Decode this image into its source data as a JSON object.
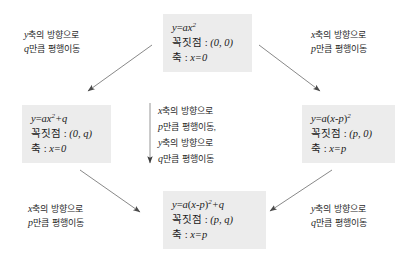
{
  "diagram": {
    "boxes": [
      {
        "id": "box-top",
        "equation_plain": "y=ax2",
        "equation_parts": {
          "lhs": "y",
          "eq": "=",
          "coef": "a",
          "var": "x",
          "exp": "2"
        },
        "vertex_label": "꼭짓점 :",
        "vertex_value": "(0, 0)",
        "axis_label": "축 :",
        "axis_value": "x=0"
      },
      {
        "id": "box-left",
        "equation_plain": "y=ax2+q",
        "equation_parts": {
          "lhs": "y",
          "eq": "=",
          "coef": "a",
          "var": "x",
          "exp": "2",
          "tail": "+q"
        },
        "vertex_label": "꼭짓점 :",
        "vertex_value": "(0, q)",
        "axis_label": "축 :",
        "axis_value": "x=0"
      },
      {
        "id": "box-right",
        "equation_plain": "y=a(x-p)2",
        "equation_parts": {
          "lhs": "y",
          "eq": "=",
          "coef": "a",
          "open": "(",
          "var": "x",
          "minus": "-",
          "param": "p",
          "close": ")",
          "exp": "2"
        },
        "vertex_label": "꼭짓점 :",
        "vertex_value": "(p, 0)",
        "axis_label": "축 :",
        "axis_value": "x=p"
      },
      {
        "id": "box-bottom",
        "equation_plain": "y=a(x-p)2+q",
        "equation_parts": {
          "lhs": "y",
          "eq": "=",
          "coef": "a",
          "open": "(",
          "var": "x",
          "minus": "-",
          "param": "p",
          "close": ")",
          "exp": "2",
          "tail": "+q"
        },
        "vertex_label": "꼭짓점 :",
        "vertex_value": "(p, q)",
        "axis_label": "축 :",
        "axis_value": "x=p"
      }
    ],
    "labels": {
      "top_left": {
        "line1_var": "y",
        "line1_text": "축의 방향으로",
        "line2_var": "q",
        "line2_text": "만큼 평행이동"
      },
      "top_right": {
        "line1_var": "x",
        "line1_text": "축의 방향으로",
        "line2_var": "p",
        "line2_text": "만큼 평행이동"
      },
      "bottom_left": {
        "line1_var": "x",
        "line1_text": "축의 방향으로",
        "line2_var": "p",
        "line2_text": "만큼 평행이동"
      },
      "bottom_right": {
        "line1_var": "y",
        "line1_text": "축의 방향으로",
        "line2_var": "q",
        "line2_text": "만큼 평행이동"
      },
      "center": {
        "line1_var": "x",
        "line1_text": "축의 방향으로",
        "line2_var": "p",
        "line2_text": "만큼 평행이동,",
        "line3_var": "y",
        "line3_text": "축의 방향으로",
        "line4_var": "q",
        "line4_text": "만큼 평행이동"
      }
    },
    "colors": {
      "box_fill": "#ececec",
      "text": "#1a1a1a",
      "label_text": "#2b2b2b",
      "arrow": "#6f6f6f",
      "background": "#ffffff"
    }
  }
}
